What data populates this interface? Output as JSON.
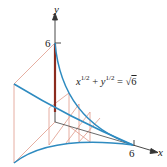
{
  "figure": {
    "type": "solid-of-known-cross-section diagram",
    "axes": {
      "y_label": "y",
      "x_label": "x",
      "y_tick_label": "6",
      "x_tick_label": "6"
    },
    "equation": {
      "x_term": "x",
      "y_term": "y",
      "exponent": "1/2",
      "plus": "+",
      "equals": "=",
      "sqrt_symbol": "√",
      "sqrt_value": "6"
    },
    "colors": {
      "curve": "#2e8bc0",
      "cross_section_lines": "#e09a8a",
      "highlight_slice": "#8b2b1e",
      "axes": "#333333"
    }
  }
}
